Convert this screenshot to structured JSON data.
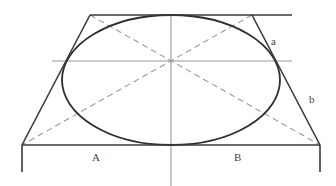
{
  "diagram": {
    "title": "",
    "labels": {
      "a": "a",
      "b": "b",
      "A": "A",
      "B": "B"
    },
    "colors": {
      "solid_line": "#3a3a3a",
      "construction_line": "#9a9a9a",
      "ellipse": "#2e2e2e",
      "background": "#ffffff"
    },
    "shapes": {
      "trapezoid": {
        "top_left": [
          90,
          15
        ],
        "top_right": [
          252,
          15
        ],
        "bottom_left": [
          22,
          145
        ],
        "bottom_right": [
          320,
          145
        ]
      },
      "top_line": {
        "from": [
          90,
          15
        ],
        "to": [
          292,
          15
        ]
      },
      "ellipse": {
        "cx": 171,
        "cy": 80,
        "rx": 109,
        "ry": 65
      },
      "center_lines": {
        "horizontal_y": 61,
        "vertical_x": 171
      },
      "diagonals": [
        {
          "from": [
            90,
            15
          ],
          "to": [
            320,
            145
          ]
        },
        {
          "from": [
            252,
            15
          ],
          "to": [
            22,
            145
          ]
        }
      ]
    }
  }
}
